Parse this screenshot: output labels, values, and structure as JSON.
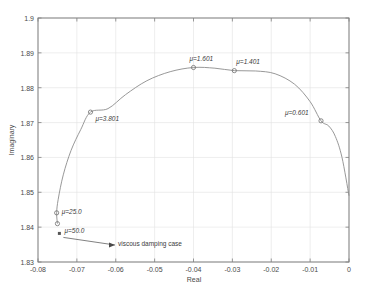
{
  "chart_data": {
    "type": "line",
    "title": "",
    "xlabel": "Real",
    "ylabel": "Imaginary",
    "xlim": [
      -0.08,
      0
    ],
    "ylim": [
      1.83,
      1.9
    ],
    "xticks": [
      -0.08,
      -0.07,
      -0.06,
      -0.05,
      -0.04,
      -0.03,
      -0.02,
      -0.01,
      0
    ],
    "xtick_labels": [
      "-0.08",
      "-0.07",
      "-0.06",
      "-0.05",
      "-0.04",
      "-0.03",
      "-0.02",
      "-0.01",
      "0"
    ],
    "yticks": [
      1.83,
      1.84,
      1.85,
      1.86,
      1.87,
      1.88,
      1.89,
      1.9
    ],
    "ytick_labels": [
      "1.83",
      "1.84",
      "1.85",
      "1.86",
      "1.87",
      "1.88",
      "1.89",
      "1.9"
    ],
    "grid": true,
    "legend": "none",
    "series": [
      {
        "name": "root locus",
        "marker": "circle",
        "line_color": "#8c8c8c",
        "points": [
          {
            "x": 0.0,
            "y": 1.849
          },
          {
            "x": -0.0018,
            "y": 1.86
          },
          {
            "x": -0.0035,
            "y": 1.866
          },
          {
            "x": -0.0052,
            "y": 1.869
          },
          {
            "x": -0.0072,
            "y": 1.8705
          },
          {
            "x": -0.01,
            "y": 1.876
          },
          {
            "x": -0.014,
            "y": 1.881
          },
          {
            "x": -0.019,
            "y": 1.884
          },
          {
            "x": -0.024,
            "y": 1.8848
          },
          {
            "x": -0.0295,
            "y": 1.8849
          },
          {
            "x": -0.0345,
            "y": 1.8856
          },
          {
            "x": -0.04,
            "y": 1.8858
          },
          {
            "x": -0.046,
            "y": 1.8846
          },
          {
            "x": -0.052,
            "y": 1.882
          },
          {
            "x": -0.0575,
            "y": 1.878
          },
          {
            "x": -0.062,
            "y": 1.874
          },
          {
            "x": -0.0665,
            "y": 1.873
          },
          {
            "x": -0.069,
            "y": 1.868
          },
          {
            "x": -0.0715,
            "y": 1.862
          },
          {
            "x": -0.0735,
            "y": 1.855
          },
          {
            "x": -0.0748,
            "y": 1.848
          },
          {
            "x": -0.0752,
            "y": 1.8441
          },
          {
            "x": -0.075,
            "y": 1.841
          }
        ]
      }
    ],
    "markers": [
      {
        "id": "mu-1p601",
        "x": -0.04,
        "y": 1.8858,
        "label": "μ=1.601",
        "label_dx": -4,
        "label_dy": -12
      },
      {
        "id": "mu-1p401",
        "x": -0.0295,
        "y": 1.8849,
        "label": "μ=1.401",
        "label_dx": 2,
        "label_dy": -13
      },
      {
        "id": "mu-3p801",
        "x": -0.0665,
        "y": 1.873,
        "label": "μ=3.801",
        "label_dx": 5,
        "label_dy": 3
      },
      {
        "id": "mu-0p601",
        "x": -0.0072,
        "y": 1.8705,
        "label": "μ=0.601",
        "label_dx": -36,
        "label_dy": -12
      },
      {
        "id": "mu-25p0",
        "x": -0.0752,
        "y": 1.8441,
        "label": "μ=25.0",
        "label_dx": 5,
        "label_dy": -5
      },
      {
        "id": "mu-50p0",
        "x": -0.075,
        "y": 1.841,
        "label": "μ=50.0",
        "label_dx": 7,
        "label_dy": 3
      }
    ],
    "special_point": {
      "id": "viscous-damping-point",
      "x": -0.0745,
      "y": 1.8382,
      "marker": "filled-square"
    },
    "annotation": {
      "text": "viscous damping case",
      "arrow_from_x": 0.0,
      "arrow_from_y": 0.0,
      "text_x": -0.0355,
      "text_y": 1.8355
    }
  },
  "colors": {
    "axis": "#808080",
    "grid": "#e2e2e2",
    "curve": "#8c8c8c",
    "text": "#4a4a4a",
    "background": "#ffffff"
  }
}
